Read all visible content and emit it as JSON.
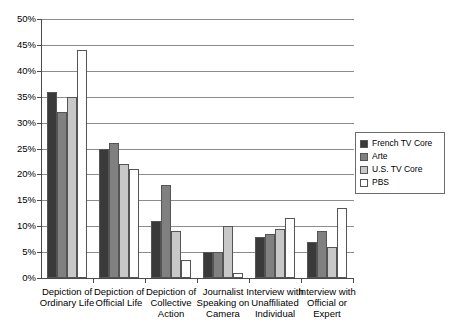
{
  "chart_data": {
    "type": "bar",
    "title": "",
    "subtitle": "",
    "xlabel": "",
    "ylabel": "",
    "ylim": [
      0,
      50
    ],
    "ytick_labels": [
      "50%",
      "45%",
      "40%",
      "35%",
      "30%",
      "25%",
      "20%",
      "15%",
      "10%",
      "5%",
      "0%"
    ],
    "ytick_values": [
      50,
      45,
      40,
      35,
      30,
      25,
      20,
      15,
      10,
      5,
      0
    ],
    "grid": true,
    "legend_position": "right",
    "categories": [
      "Depiction of Ordinary Life",
      "Depiction of Official Life",
      "Depiction of Collective Action",
      "Journalist Speaking on Camera",
      "Interview with Unaffiliated Individual",
      "Interview with Official or Expert"
    ],
    "category_lines": [
      [
        "Depiction of",
        "Ordinary Life"
      ],
      [
        "Depiction of",
        "Official Life"
      ],
      [
        "Depiction of",
        "Collective",
        "Action"
      ],
      [
        "Journalist",
        "Speaking on",
        "Camera"
      ],
      [
        "Interview with",
        "Unaffiliated",
        "Individual"
      ],
      [
        "Interview with",
        "Official or",
        "Expert"
      ]
    ],
    "series": [
      {
        "name": "French TV Core",
        "color": "#3a3a3a",
        "values": [
          36,
          25,
          11,
          5,
          8,
          7
        ]
      },
      {
        "name": "Arte",
        "color": "#808080",
        "values": [
          32,
          26,
          18,
          5,
          8.5,
          9
        ]
      },
      {
        "name": "U.S. TV Core",
        "color": "#c8c8c8",
        "values": [
          35,
          22,
          9,
          10,
          9.5,
          6
        ]
      },
      {
        "name": "PBS",
        "color": "#ffffff",
        "values": [
          44,
          21,
          3.5,
          1,
          11.5,
          13.5
        ]
      }
    ]
  }
}
